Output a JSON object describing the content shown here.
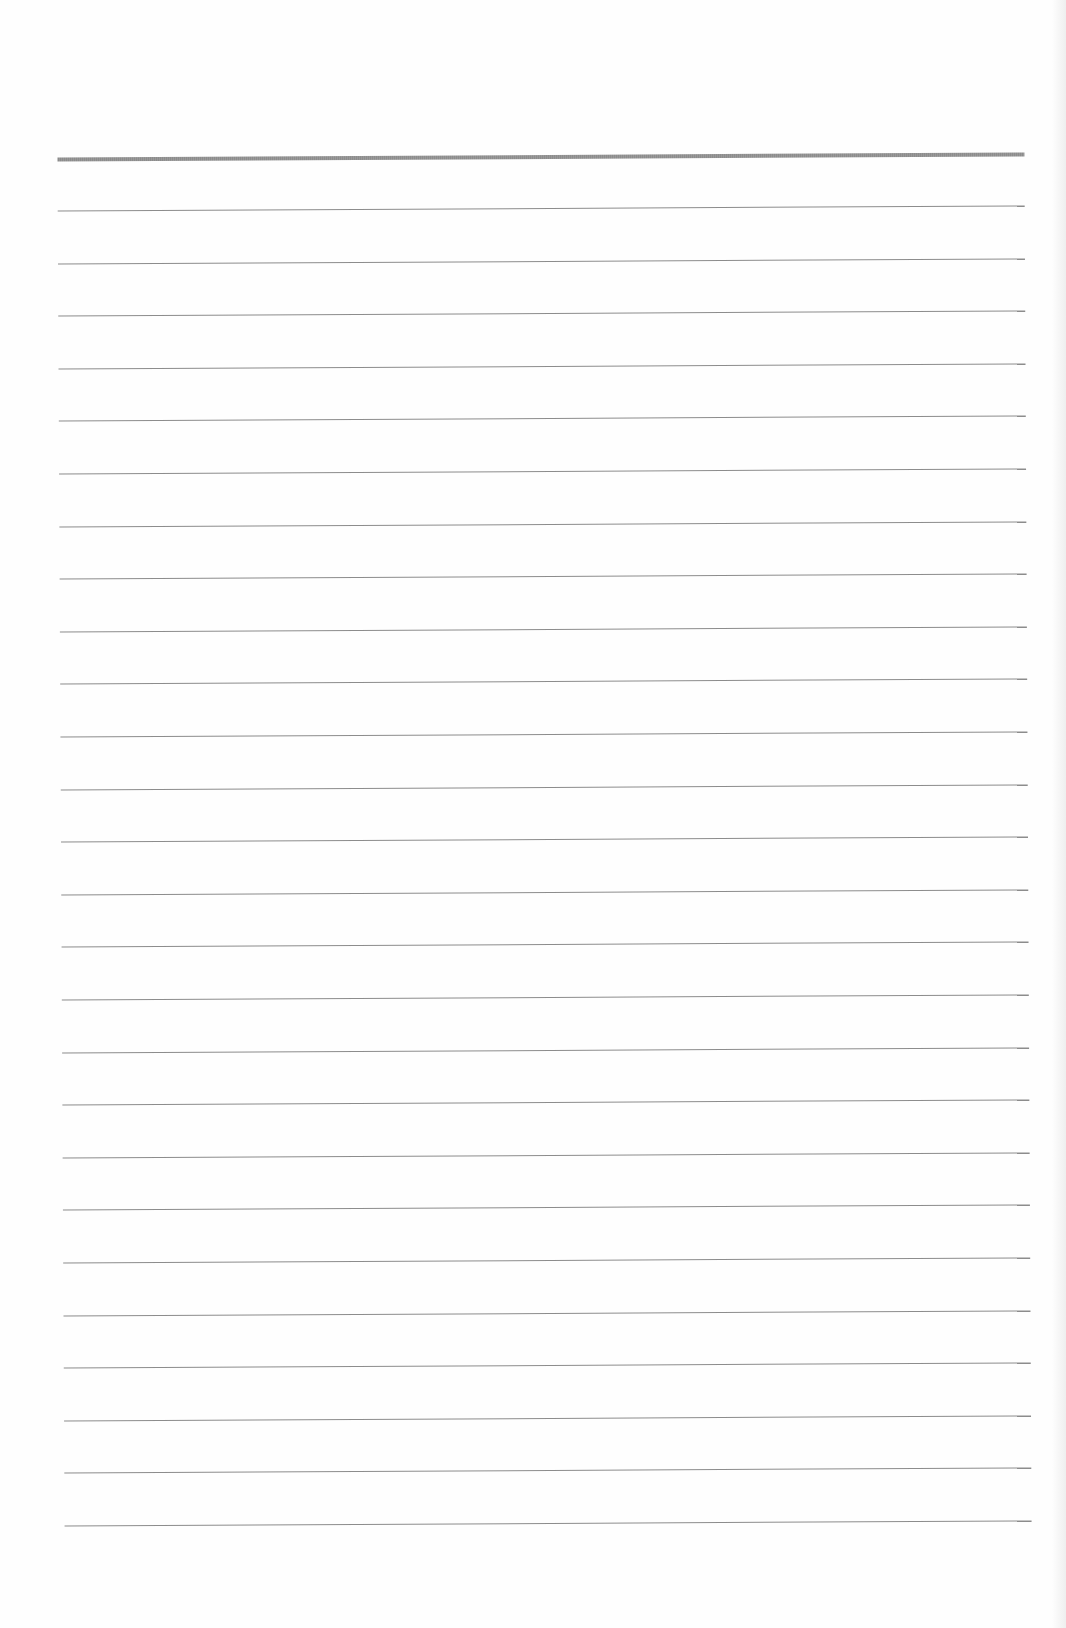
{
  "page": {
    "type": "lined-paper",
    "background": "#fefefe",
    "rule_color": "#8c8c8c",
    "header_rule": {
      "top": 155,
      "thickness": 4
    },
    "rules": {
      "count": 26,
      "first_top": 208,
      "spacing": 52.6,
      "thickness": 1
    }
  }
}
